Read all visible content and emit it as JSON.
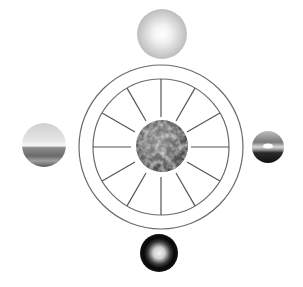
{
  "diagram": {
    "canvas": {
      "width": 303,
      "height": 287,
      "background": "#ffffff"
    },
    "wheel": {
      "center": [
        161,
        147
      ],
      "outer_radius": 82,
      "inner_radius": 68,
      "stroke": "#6a6a6a",
      "spoke_count": 12,
      "spoke_inner_radius": 30,
      "spoke_stroke": "#555555"
    },
    "center_sphere": {
      "name": "earth",
      "center": [
        162,
        146
      ],
      "radius": 26,
      "base_color": "#6e6e6e",
      "highlight_color": "#bdbdbd",
      "shadow_color": "#3a3a3a"
    },
    "outer_spheres": [
      {
        "name": "noon-sun",
        "position": "top",
        "center": [
          162,
          34
        ],
        "radius": 25,
        "edge_color": "#bfbfbf",
        "core_color": "#ffffff"
      },
      {
        "name": "seascape-horizon",
        "position": "left",
        "center": [
          44,
          145
        ],
        "radius": 22,
        "sky_color": "#d6d6d6",
        "water_color": "#6a6a6a",
        "horizon_glow": "#f4f4f4"
      },
      {
        "name": "sunset",
        "position": "right",
        "center": [
          268,
          147
        ],
        "radius": 16,
        "sky_color": "#8a8a8a",
        "sun_color": "#ffffff",
        "ground_color": "#1a1a1a"
      },
      {
        "name": "night-glow",
        "position": "bottom",
        "center": [
          159,
          253
        ],
        "radius": 19,
        "edge_color": "#0a0a0a",
        "core_color": "#f2f2f2"
      }
    ]
  }
}
